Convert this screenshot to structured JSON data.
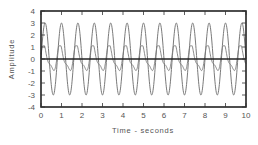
{
  "chart_data": {
    "type": "line",
    "title": "",
    "xlabel": "Time - seconds",
    "ylabel": "Amplitude",
    "xlim": [
      0,
      10
    ],
    "ylim": [
      -4,
      4
    ],
    "x_ticks": [
      "0",
      "1",
      "2",
      "3",
      "4",
      "5",
      "6",
      "7",
      "8",
      "9",
      "10"
    ],
    "y_ticks": [
      "4",
      "3",
      "2",
      "1",
      "0",
      "-1",
      "-2",
      "-3",
      "-4"
    ],
    "grid": false,
    "legend": null,
    "series": [
      {
        "name": "large sinusoid",
        "amplitude": 3,
        "frequency_hz": 1.25,
        "phase_rad": 1.5708,
        "color": "#777777"
      },
      {
        "name": "small waveform",
        "amplitude": 1,
        "frequency_hz": 1.25,
        "phase_rad": 0.4,
        "harmonic_amplitude": 0.35,
        "color": "#777777"
      },
      {
        "name": "zero line",
        "value": 0,
        "color": "#222222"
      }
    ]
  },
  "colors": {
    "frame": "#222222",
    "wave": "#7a7a7a",
    "text": "#555555"
  }
}
